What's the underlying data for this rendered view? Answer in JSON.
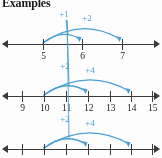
{
  "title": "Examples",
  "colors": {
    "arc": "#4a9fd4",
    "axis": "#3a3a3a",
    "label": "#1f1f1f",
    "background": "#fdfdfd"
  },
  "number_lines": [
    {
      "id": "number-line-1",
      "ticks": [
        {
          "label": "5",
          "x": 43
        },
        {
          "label": "6",
          "x": 82
        },
        {
          "label": "7",
          "x": 122
        }
      ],
      "arcs": [
        {
          "label": "+1",
          "from_x": 43,
          "to_x": 80,
          "peak": 12,
          "label_x": 64,
          "label_y": 9
        },
        {
          "label": "+2",
          "from_x": 43,
          "to_x": 120,
          "peak": 21,
          "label_x": 87,
          "label_y": 13
        }
      ]
    },
    {
      "id": "number-line-2",
      "ticks": [
        {
          "label": "9",
          "x": 22
        },
        {
          "label": "10",
          "x": 44
        },
        {
          "label": "11",
          "x": 66
        },
        {
          "label": "12",
          "x": 88
        },
        {
          "label": "13",
          "x": 110
        },
        {
          "label": "14",
          "x": 131
        },
        {
          "label": "15",
          "x": 152
        }
      ],
      "arcs": [
        {
          "label": "+2",
          "from_x": 44,
          "to_x": 86,
          "peak": 13,
          "label_x": 65,
          "label_y": 9
        },
        {
          "label": "+4",
          "from_x": 44,
          "to_x": 129,
          "peak": 22,
          "label_x": 90,
          "label_y": 13
        }
      ]
    },
    {
      "id": "number-line-3",
      "ticks": [
        {
          "label": "",
          "x": 22
        },
        {
          "label": "",
          "x": 44
        },
        {
          "label": "",
          "x": 66
        },
        {
          "label": "",
          "x": 88
        },
        {
          "label": "",
          "x": 110
        },
        {
          "label": "",
          "x": 131
        },
        {
          "label": "",
          "x": 152
        }
      ],
      "arcs": [
        {
          "label": "+2",
          "from_x": 44,
          "to_x": 86,
          "peak": 13,
          "label_x": 65,
          "label_y": 9
        },
        {
          "label": "+4",
          "from_x": 44,
          "to_x": 129,
          "peak": 22,
          "label_x": 90,
          "label_y": 13
        }
      ]
    }
  ]
}
